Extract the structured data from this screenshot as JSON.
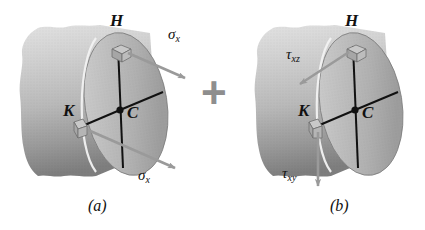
{
  "figure": {
    "type": "engineering-diagram",
    "background_color": "#ffffff",
    "shaft_color_light": "#d8d8d8",
    "shaft_color_mid": "#b4b4b4",
    "shaft_color_dark": "#8a8a8a",
    "line_color": "#111111",
    "arrow_color": "#9a9a9a",
    "plus_color": "#8e8e8e"
  },
  "panel_a": {
    "caption": "(a)",
    "point_h": "H",
    "point_k": "K",
    "center": "C",
    "stress_upper": {
      "symbol": "σ",
      "subscript": "x"
    },
    "stress_lower": {
      "symbol": "σ",
      "subscript": "x"
    }
  },
  "operator": {
    "symbol": "+"
  },
  "panel_b": {
    "caption": "(b)",
    "point_h": "H",
    "point_k": "K",
    "center": "C",
    "stress_upper": {
      "symbol": "τ",
      "subscript": "xz"
    },
    "stress_lower": {
      "symbol": "τ",
      "subscript": "xy"
    }
  }
}
